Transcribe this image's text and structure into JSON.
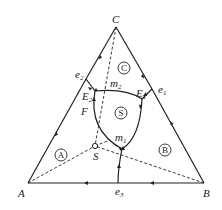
{
  "diagram": {
    "type": "ternary-phase-diagram",
    "vertices": {
      "C": {
        "label": "C",
        "x": 116,
        "y": 27
      },
      "A": {
        "label": "A",
        "x": 28,
        "y": 183
      },
      "B": {
        "label": "B",
        "x": 204,
        "y": 183
      }
    },
    "eutectic_points": [
      {
        "id": "e2",
        "label": "e",
        "sub": "2",
        "x": 86,
        "y": 79
      },
      {
        "id": "e1",
        "label": "e",
        "sub": "1",
        "x": 152,
        "y": 89
      },
      {
        "id": "e3",
        "label": "e",
        "sub": "3",
        "x": 118,
        "y": 183
      }
    ],
    "invariant_points": [
      {
        "id": "E2",
        "label": "E",
        "sub": "2",
        "x": 95,
        "y": 91
      },
      {
        "id": "E1",
        "label": "E",
        "sub": "1",
        "x": 142,
        "y": 99
      }
    ],
    "saddle_points": [
      {
        "id": "m2",
        "label": "m",
        "sub": "2",
        "x": 104,
        "y": 89
      },
      {
        "id": "m1",
        "label": "m",
        "sub": "1",
        "x": 122,
        "y": 148
      }
    ],
    "compound": {
      "label": "S",
      "x": 95,
      "y": 146
    },
    "curve_label": {
      "label": "F",
      "x": 84,
      "y": 116
    },
    "regions": [
      {
        "id": "A",
        "label": "A",
        "x": 61,
        "y": 155
      },
      {
        "id": "B",
        "label": "B",
        "x": 165,
        "y": 150
      },
      {
        "id": "C",
        "label": "C",
        "x": 124,
        "y": 68
      },
      {
        "id": "S",
        "label": "S",
        "x": 121,
        "y": 113
      }
    ],
    "colors": {
      "line": "#222222",
      "background": "#ffffff"
    }
  }
}
